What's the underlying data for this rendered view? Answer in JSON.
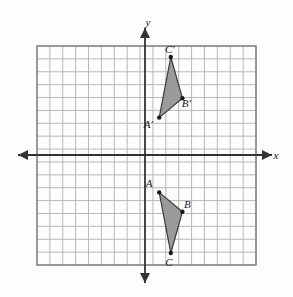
{
  "figure": {
    "title": "",
    "background_color": "#fdfdfd",
    "width": 293,
    "height": 297
  },
  "axes": {
    "x_label": "x",
    "y_label": "y",
    "axis_color": "#333333",
    "origin_px": [
      145,
      155
    ],
    "unit_px": 12.9
  },
  "grid": {
    "line_color": "#b0b0b0",
    "border_color": "#777777",
    "columns": 17,
    "rows": 17,
    "left_px": 37,
    "top_px": 46,
    "right_px": 256,
    "bottom_px": 265,
    "visible": true
  },
  "chart_data": {
    "type": "scatter",
    "title": "",
    "xlabel": "x",
    "ylabel": "y",
    "xlim": [
      -8.4,
      8.6
    ],
    "ylim": [
      -8.5,
      8.5
    ],
    "grid": true,
    "legend": "none",
    "shape_fill_color": "#9a9a9a",
    "shape_edge_color": "#3a3a3a",
    "vertex_marker_color": "#1a1a1a",
    "annotations": [
      "Triangle ABC is reflected across the x-axis to produce triangle A'B'C'."
    ],
    "series": [
      {
        "name": "Triangle A'B'C'",
        "closed": true,
        "points": [
          {
            "label": "A'",
            "x": 1.1,
            "y": 2.9,
            "label_dx": -11,
            "label_dy": 10
          },
          {
            "label": "B'",
            "x": 2.9,
            "y": 4.4,
            "label_dx": 4,
            "label_dy": 9
          },
          {
            "label": "C'",
            "x": 2.0,
            "y": 7.6,
            "label_dx": -1,
            "label_dy": -4
          }
        ]
      },
      {
        "name": "Triangle ABC",
        "closed": true,
        "points": [
          {
            "label": "A",
            "x": 1.1,
            "y": -2.9,
            "label_dx": -10,
            "label_dy": -5
          },
          {
            "label": "B",
            "x": 2.9,
            "y": -4.4,
            "label_dx": 5,
            "label_dy": -4
          },
          {
            "label": "C",
            "x": 2.0,
            "y": -7.6,
            "label_dx": -2,
            "label_dy": 13
          }
        ]
      }
    ]
  }
}
